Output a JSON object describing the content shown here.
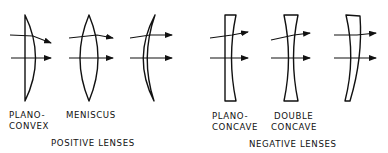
{
  "figure": {
    "colors": {
      "ink": "#111111",
      "background": "#ffffff"
    },
    "positive_group": {
      "title": "POSITIVE LENSES",
      "lenses": [
        {
          "name": "plano-convex",
          "label_line1": "PLANO-",
          "label_line2": "CONVEX"
        },
        {
          "name": "biconvex",
          "label_line1": "MENISCUS",
          "label_line2": ""
        },
        {
          "name": "positive-meniscus",
          "label_line1": "",
          "label_line2": ""
        }
      ]
    },
    "negative_group": {
      "title": "NEGATIVE LENSES",
      "lenses": [
        {
          "name": "plano-concave",
          "label_line1": "PLANO-",
          "label_line2": "CONCAVE"
        },
        {
          "name": "double-concave",
          "label_line1": "DOUBLE",
          "label_line2": "CONCAVE"
        },
        {
          "name": "negative-meniscus",
          "label_line1": "",
          "label_line2": ""
        }
      ]
    }
  }
}
